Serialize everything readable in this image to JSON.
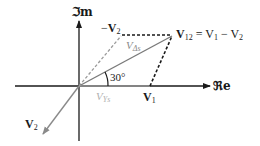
{
  "diagram": {
    "axes": {
      "imag_label": "ℑm",
      "real_label": "ℜe"
    },
    "angle": {
      "label": "30°"
    },
    "vectors": {
      "v1": {
        "label": "V",
        "sub": "1"
      },
      "v2": {
        "label": "V",
        "sub": "2"
      },
      "neg_v2": {
        "prefix": "−",
        "label": "V",
        "sub": "2"
      },
      "v12": {
        "label": "V",
        "sub": "12",
        "equation": " = V",
        "eq_sub1": "1",
        "eq_mid": " − V",
        "eq_sub2": "2"
      },
      "v_delta_s": {
        "label": "V",
        "sub": "Δs"
      },
      "v_y_s": {
        "label": "V",
        "sub": "Ys"
      }
    },
    "colors": {
      "axis": "#1a1a1a",
      "gray_vector": "#8a8a8a",
      "dashed_black": "#1a1a1a",
      "label_gray": "#9a9a9a"
    }
  }
}
